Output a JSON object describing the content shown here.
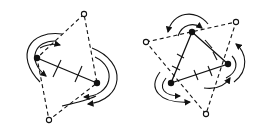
{
  "figure": {
    "panels": [
      {
        "id": "left",
        "description": "Two filled vertices joined by a solid edge, two open vertices joined via dashed edges forming a quadrilateral; curved flow arrows circulate around the structure",
        "filled_vertices": 2,
        "open_vertices": 2
      },
      {
        "id": "right",
        "description": "Three filled vertices forming a solid triangle, three open vertices joined via dashed edges forming a dual triangle; curved flow arrows circulate around",
        "filled_vertices": 3,
        "open_vertices": 3
      }
    ]
  }
}
